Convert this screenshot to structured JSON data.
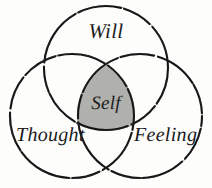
{
  "diagram": {
    "type": "venn-3-circle",
    "title_present": false,
    "background_color": "#fdfdfc",
    "stroke_color": "#151515",
    "intersection_fill": "#b0b0ac",
    "text_color": "#1b1b1b",
    "circles": [
      {
        "id": "will",
        "label": "Will",
        "position": "top",
        "cx": 106,
        "cy": 68,
        "r": 62
      },
      {
        "id": "thought",
        "label": "Thought",
        "position": "bottom-left",
        "cx": 72,
        "cy": 116,
        "r": 62
      },
      {
        "id": "feeling",
        "label": "Feeling",
        "position": "bottom-right",
        "cx": 140,
        "cy": 116,
        "r": 62
      }
    ],
    "center_region": {
      "id": "self",
      "label": "Self",
      "shaded": true,
      "fill": "#b0b0ac"
    }
  }
}
